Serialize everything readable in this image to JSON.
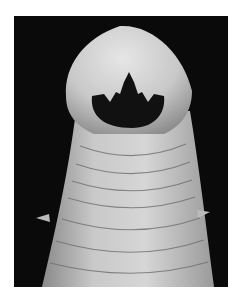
{
  "image": {
    "subject": "scanning electron micrograph of a worm head with open mouth and tooth-like projections",
    "alt": "Hookworm head SEM micrograph",
    "colors": {
      "background": "#0a0a0a",
      "body_light": "#d9d9d9",
      "body_mid": "#bdbdbd",
      "body_dark": "#8a8a8a",
      "mouth": "#111111",
      "border": "#ffffff"
    }
  }
}
